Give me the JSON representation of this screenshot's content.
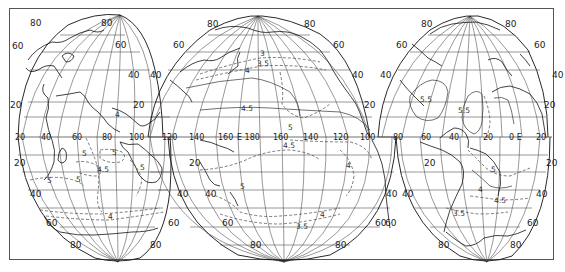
{
  "map": {
    "projection": "interrupted-world",
    "lobes": [
      {
        "name": "indian-ocean-lobe",
        "north_labels": {
          "left_80": "80",
          "right_80": "80",
          "left_60": "60",
          "right_60": "60",
          "right_40": "40",
          "left_20": "20",
          "right_20": "20"
        },
        "south_labels": {
          "left_20": "20",
          "left_40": "40",
          "right_40": "40",
          "left_60": "60",
          "right_60": "60",
          "left_80": "80",
          "right_80": "80"
        },
        "isolines": [
          "4",
          "5",
          "5",
          "5",
          "4.5",
          "5",
          "5",
          "4"
        ]
      },
      {
        "name": "pacific-lobe",
        "north_labels": {
          "left_80": "80",
          "right_80": "80",
          "left_60": "60",
          "right_60": "60",
          "left_40": "40",
          "right_40": "40",
          "right_20": "20"
        },
        "south_labels": {
          "left_20": "20",
          "left_40": "40",
          "right_40": "40",
          "left_60": "60",
          "right_60": "60",
          "left_80": "80",
          "right_80": "80"
        },
        "isolines": [
          "3",
          "3.5",
          "4",
          "4.5",
          "5",
          "4.5",
          "4",
          "5",
          "4",
          "3.5"
        ]
      },
      {
        "name": "atlantic-lobe",
        "north_labels": {
          "left_80": "80",
          "right_80": "80",
          "left_60": "60",
          "right_60": "60",
          "left_40": "40",
          "right_40": "40",
          "right_20": "20"
        },
        "south_labels": {
          "left_20": "20",
          "right_20": "20",
          "left_40": "40",
          "right_40": "40",
          "left_60": "60",
          "right_60": "60",
          "left_80": "80",
          "right_80": "80"
        },
        "isolines": [
          "5.5",
          "5.5",
          "5",
          "4",
          "4.5",
          "3.5"
        ]
      }
    ],
    "equator_longitudes": [
      "20",
      "40",
      "60",
      "80",
      "100",
      "120",
      "140",
      "160",
      "E 180",
      "160",
      "140",
      "120",
      "100",
      "80",
      "60",
      "40",
      "20",
      "0 E",
      "20"
    ]
  }
}
